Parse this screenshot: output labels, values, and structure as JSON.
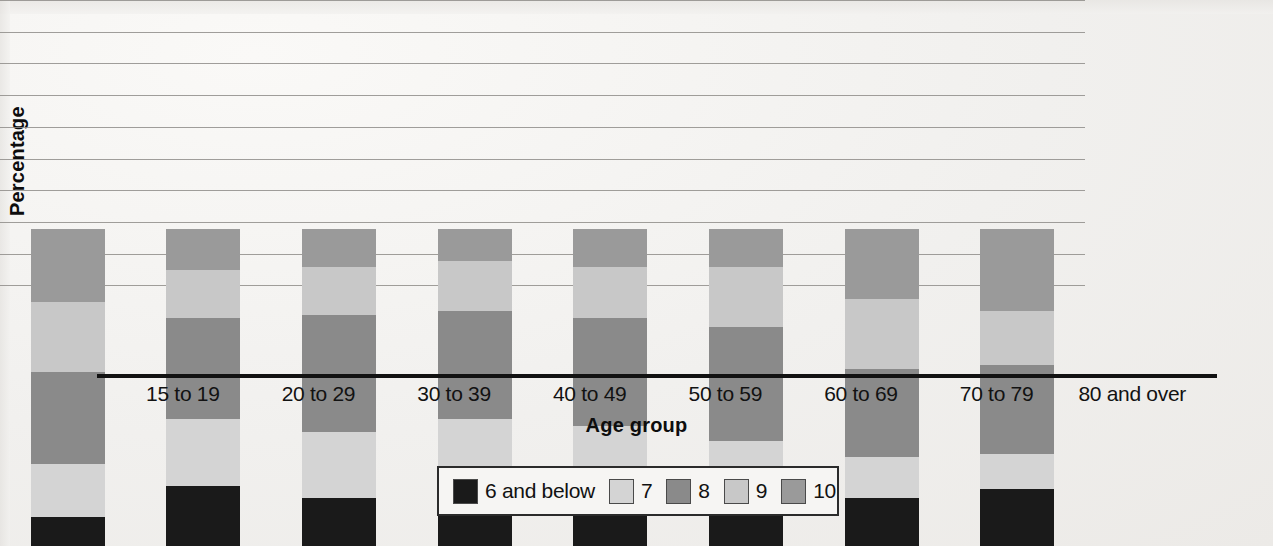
{
  "chart_data": {
    "type": "bar",
    "subtype": "stacked-bar-100",
    "title": "",
    "xlabel": "Age group",
    "ylabel": "Percentage",
    "ylim": [
      0,
      100
    ],
    "ytick_step": 10,
    "yticks": [
      100,
      90,
      80,
      70,
      60,
      50,
      40,
      30,
      20,
      10,
      0
    ],
    "grid": true,
    "grid_axis": "y",
    "legend_position": "bottom-center",
    "categories": [
      "15 to 19",
      "20 to 29",
      "30 to 39",
      "40 to 49",
      "50 to 59",
      "60 to 69",
      "70 to 79",
      "80 and over"
    ],
    "series": [
      {
        "name": "6 and below",
        "color": "#1a1a1a",
        "values": [
          9,
          19,
          15,
          19,
          20,
          18,
          15,
          18
        ]
      },
      {
        "name": "7",
        "color": "#d4d4d4",
        "values": [
          17,
          21,
          21,
          21,
          18,
          15,
          13,
          11
        ]
      },
      {
        "name": "8",
        "color": "#8a8a8a",
        "values": [
          29,
          32,
          37,
          34,
          34,
          36,
          28,
          28
        ]
      },
      {
        "name": "9",
        "color": "#c8c8c8",
        "values": [
          22,
          15,
          15,
          16,
          16,
          19,
          22,
          17
        ]
      },
      {
        "name": "10",
        "color": "#9a9a9a",
        "values": [
          23,
          13,
          12,
          10,
          12,
          12,
          22,
          26
        ]
      }
    ]
  },
  "axes": {
    "y_title": "Percentage",
    "x_title": "Age group"
  },
  "legend": {
    "items": [
      {
        "label": "6 and below",
        "color": "#1a1a1a"
      },
      {
        "label": "7",
        "color": "#d4d4d4"
      },
      {
        "label": "8",
        "color": "#8a8a8a"
      },
      {
        "label": "9",
        "color": "#c8c8c8"
      },
      {
        "label": "10",
        "color": "#9a9a9a"
      }
    ]
  }
}
